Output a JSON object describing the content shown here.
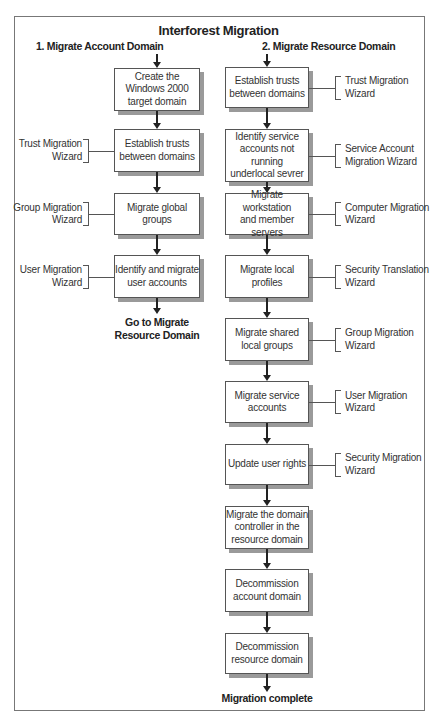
{
  "title": "Interforest Migration",
  "columns": [
    {
      "heading": "1. Migrate Account Domain",
      "steps": [
        {
          "label": "Create the Windows 2000 target domain",
          "wizard": ""
        },
        {
          "label": "Establish trusts between domains",
          "wizard": "Trust Migration Wizard"
        },
        {
          "label": "Migrate global groups",
          "wizard": "Group Migration Wizard"
        },
        {
          "label": "Identify and migrate user accounts",
          "wizard": "User Migration Wizard"
        }
      ],
      "end_label": "Go to Migrate Resource Domain"
    },
    {
      "heading": "2. Migrate Resource Domain",
      "steps": [
        {
          "label": "Establish trusts between domains",
          "wizard": "Trust Migration Wizard"
        },
        {
          "label": "Identify service accounts not running underlocal sevrer",
          "wizard": "Service Account Migration Wizard"
        },
        {
          "label": "Migrate workstation and member servers",
          "wizard": "Computer Migration Wizard"
        },
        {
          "label": "Migrate local profiles",
          "wizard": "Security Translation Wizard"
        },
        {
          "label": "Migrate shared local groups",
          "wizard": "Group Migration Wizard"
        },
        {
          "label": "Migrate service accounts",
          "wizard": "User Migration Wizard"
        },
        {
          "label": "Update user rights",
          "wizard": "Security Migration Wizard"
        },
        {
          "label": "Migrate the domain controller in the resource domain",
          "wizard": ""
        },
        {
          "label": "Decommission account domain",
          "wizard": ""
        },
        {
          "label": "Decommission resource domain",
          "wizard": ""
        }
      ],
      "end_label": "Migration complete"
    }
  ],
  "display": {
    "left_steps": [
      [
        "Create the",
        "Windows 2000",
        "target domain"
      ],
      [
        "Establish trusts",
        "between domains"
      ],
      [
        "Migrate global groups"
      ],
      [
        "Identify and migrate",
        "user accounts"
      ]
    ],
    "left_wizards": [
      null,
      [
        "Trust Migration",
        "Wizard"
      ],
      [
        "Group Migration",
        "Wizard"
      ],
      [
        "User Migration",
        "Wizard"
      ]
    ],
    "left_end": [
      "Go to Migrate",
      "Resource Domain"
    ],
    "right_steps": [
      [
        "Establish trusts",
        "between domains"
      ],
      [
        "Identify service",
        "accounts not running",
        "underlocal sevrer"
      ],
      [
        "Migrate workstation",
        "and member servers"
      ],
      [
        "Migrate local profiles"
      ],
      [
        "Migrate shared",
        "local groups"
      ],
      [
        "Migrate service",
        "accounts"
      ],
      [
        "Update user rights"
      ],
      [
        "Migrate the domain",
        "controller in the",
        "resource domain"
      ],
      [
        "Decommission",
        "account domain"
      ],
      [
        "Decommission",
        "resource domain"
      ]
    ],
    "right_wizards": [
      [
        "Trust Migration",
        "Wizard"
      ],
      [
        "Service Account",
        "Migration Wizard"
      ],
      [
        "Computer Migration",
        "Wizard"
      ],
      [
        "Security Translation",
        "Wizard"
      ],
      [
        "Group Migration",
        "Wizard"
      ],
      [
        "User Migration",
        "Wizard"
      ],
      [
        "Security Migration",
        "Wizard"
      ],
      null,
      null,
      null
    ]
  },
  "colors": {
    "frame_border": "#777777",
    "box_border": "#555555",
    "box_shadow": "#9a9a9a",
    "arrow": "#222222",
    "text": "#333333"
  }
}
